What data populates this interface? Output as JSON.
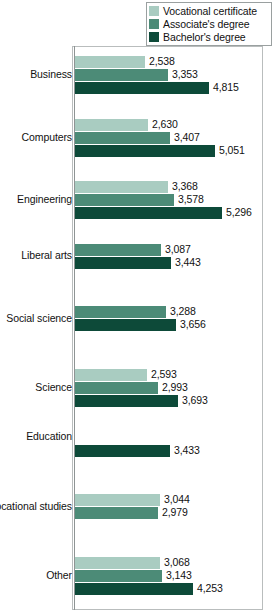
{
  "chart_data": {
    "type": "bar",
    "orientation": "horizontal",
    "title": "",
    "xlabel": "",
    "ylabel": "",
    "grid": false,
    "legend_position": "top-right",
    "axis_max": 5600,
    "categories": [
      "Business",
      "Computers",
      "Engineering",
      "Liberal arts",
      "Social science",
      "Science",
      "Education",
      "Vocational studies",
      "Other"
    ],
    "series": [
      {
        "name": "Vocational certificate",
        "color": "#a9ccc1",
        "values": [
          2538,
          2630,
          3368,
          null,
          null,
          2593,
          null,
          3044,
          3068
        ],
        "labels": [
          "2,538",
          "2,630",
          "3,368",
          "",
          "",
          "2,593",
          "",
          "3,044",
          "3,068"
        ]
      },
      {
        "name": "Associate's degree",
        "color": "#4c8b77",
        "values": [
          3353,
          3407,
          3578,
          3087,
          3288,
          2993,
          null,
          2979,
          3143
        ],
        "labels": [
          "3,353",
          "3,407",
          "3,578",
          "3,087",
          "3,288",
          "2,993",
          "",
          "2,979",
          "3,143"
        ]
      },
      {
        "name": "Bachelor's degree",
        "color": "#0d4a39",
        "values": [
          4815,
          5051,
          5296,
          3443,
          3656,
          3693,
          3433,
          null,
          4253
        ],
        "labels": [
          "4,815",
          "5,051",
          "5,296",
          "3,443",
          "3,656",
          "3,693",
          "3,433",
          "",
          "4,253"
        ]
      }
    ]
  },
  "legend": {
    "items": [
      {
        "label": "Vocational certificate",
        "color": "#a9ccc1"
      },
      {
        "label": "Associate's degree",
        "color": "#4c8b77"
      },
      {
        "label": "Bachelor's degree",
        "color": "#0d4a39"
      }
    ]
  }
}
